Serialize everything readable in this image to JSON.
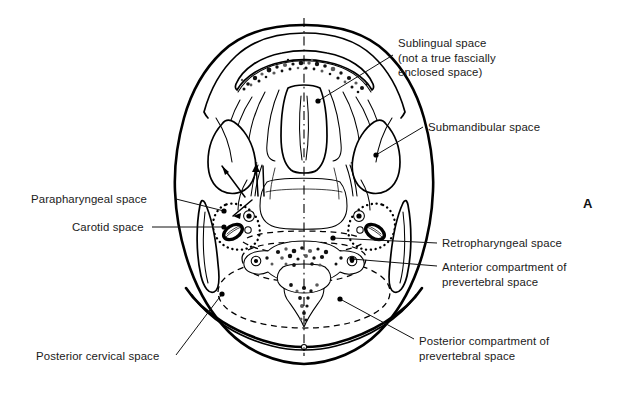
{
  "figure": {
    "letter": "A",
    "kind": "anatomical-axial-cross-section",
    "region": "suprahyoid and infrahyoid neck fascial spaces",
    "background_color": "#ffffff",
    "ink_color": "#000000"
  },
  "labels": [
    {
      "id": "sublingual",
      "name": "sublingual-space-label",
      "side": "right",
      "lines": [
        "Sublingual space",
        "(not a true fascially",
        "enclosed space)"
      ],
      "text_x": 398,
      "text_y": 47,
      "leader": {
        "from_x": 393,
        "from_y": 55,
        "to_x": 318,
        "to_y": 101
      },
      "dot": {
        "x": 318,
        "y": 101
      }
    },
    {
      "id": "submandibular",
      "name": "submandibular-space-label",
      "side": "right",
      "lines": [
        "Submandibular space"
      ],
      "text_x": 428,
      "text_y": 131,
      "leader": {
        "from_x": 423,
        "from_y": 127,
        "to_x": 376,
        "to_y": 155
      },
      "dot": {
        "x": 376,
        "y": 155
      }
    },
    {
      "id": "parapharyngeal",
      "name": "parapharyngeal-space-label",
      "side": "left",
      "lines": [
        "Parapharyngeal space"
      ],
      "text_x": 31,
      "text_y": 203,
      "leader": {
        "from_x": 176,
        "from_y": 199,
        "to_x": 224,
        "to_y": 211
      },
      "dot": {
        "x": 224,
        "y": 211
      }
    },
    {
      "id": "carotid",
      "name": "carotid-space-label",
      "side": "left",
      "lines": [
        "Carotid space"
      ],
      "text_x": 72,
      "text_y": 231,
      "leader": {
        "from_x": 152,
        "from_y": 227,
        "to_x": 224,
        "to_y": 227
      },
      "dot": {
        "x": 224,
        "y": 227
      }
    },
    {
      "id": "retropharyngeal",
      "name": "retropharyngeal-space-label",
      "side": "right",
      "lines": [
        "Retropharyngeal space"
      ],
      "text_x": 442,
      "text_y": 247,
      "leader": {
        "from_x": 437,
        "from_y": 243,
        "to_x": 333,
        "to_y": 238
      },
      "dot": {
        "x": 333,
        "y": 238
      }
    },
    {
      "id": "anterior-prevertebral",
      "name": "anterior-compartment-prevertebral-space-label",
      "side": "right",
      "lines": [
        "Anterior compartment of",
        "prevertebral space"
      ],
      "text_x": 442,
      "text_y": 271,
      "leader": {
        "from_x": 437,
        "from_y": 266,
        "to_x": 352,
        "to_y": 259
      },
      "dot": {
        "x": 352,
        "y": 259
      }
    },
    {
      "id": "posterior-prevertebral",
      "name": "posterior-compartment-prevertebral-space-label",
      "side": "right",
      "lines": [
        "Posterior compartment of",
        "prevertebral space"
      ],
      "text_x": 419,
      "text_y": 345,
      "leader": {
        "from_x": 414,
        "from_y": 339,
        "to_x": 340,
        "to_y": 299
      },
      "dot": {
        "x": 340,
        "y": 299
      }
    },
    {
      "id": "posterior-cervical",
      "name": "posterior-cervical-space-label",
      "side": "left",
      "lines": [
        "Posterior cervical space"
      ],
      "text_x": 36,
      "text_y": 360,
      "leader": {
        "from_x": 176,
        "from_y": 355,
        "to_x": 222,
        "to_y": 294
      },
      "dot": {
        "x": 222,
        "y": 294
      }
    }
  ],
  "structures": [
    {
      "name": "mandible-arch",
      "description": "anterior mandibular bone arch with stippled marrow"
    },
    {
      "name": "tongue-intrinsic-muscles",
      "description": "midline tongue musculature with septum"
    },
    {
      "name": "sublingual-space",
      "description": "paired spaces medial to mandible above mylohyoid"
    },
    {
      "name": "submandibular-space",
      "description": "paired spaces lateral and inferior to mylohyoid"
    },
    {
      "name": "parapharyngeal-space",
      "description": "fat-filled space lateral to pharynx"
    },
    {
      "name": "carotid-space",
      "description": "dotted-outlined space containing carotid artery and jugular vein"
    },
    {
      "name": "retropharyngeal-space",
      "description": "dashed midline space posterior to pharynx"
    },
    {
      "name": "prevertebral-space-anterior",
      "description": "anterior compartment anterior to vertebral body"
    },
    {
      "name": "prevertebral-space-posterior",
      "description": "posterior compartment around posterior elements"
    },
    {
      "name": "posterior-cervical-space",
      "description": "posterolateral fat space"
    },
    {
      "name": "cervical-vertebra",
      "description": "vertebral body, transverse foramina, lamina and spinous process"
    },
    {
      "name": "pharyngeal-airway",
      "description": "central oropharyngeal lumen"
    },
    {
      "name": "midline-axis",
      "description": "dash-dot sagittal midline"
    }
  ]
}
